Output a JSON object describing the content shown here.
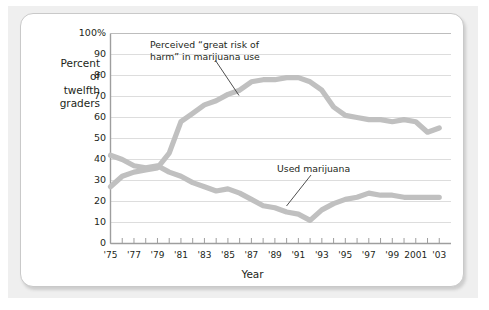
{
  "figure": {
    "y_axis_title": "Percent\nof\ntwelfth\ngraders",
    "x_axis_title": "Year",
    "frame_color": "#c9c9c9",
    "line_color": "#c0c0c0",
    "grid_color": "#d9d9d9",
    "text_color": "#231f20"
  },
  "annotations": {
    "risk": "Perceived “great risk of\nharm” in marijuana use",
    "use": "Used marijuana"
  },
  "chart_data": {
    "type": "line",
    "title": "",
    "xlabel": "Year",
    "ylabel": "Percent of twelfth graders",
    "xlim": [
      1975,
      2004
    ],
    "ylim": [
      0,
      100
    ],
    "grid": true,
    "legend_position": "inline-annotations",
    "ytick_labels": [
      "0",
      "10",
      "20",
      "30",
      "40",
      "50",
      "60",
      "70",
      "80",
      "90",
      "100%"
    ],
    "ytick_values": [
      0,
      10,
      20,
      30,
      40,
      50,
      60,
      70,
      80,
      90,
      100
    ],
    "xtick_values": [
      1975,
      1976,
      1977,
      1978,
      1979,
      1980,
      1981,
      1982,
      1983,
      1984,
      1985,
      1986,
      1987,
      1988,
      1989,
      1990,
      1991,
      1992,
      1993,
      1994,
      1995,
      1996,
      1997,
      1998,
      1999,
      2000,
      2001,
      2002,
      2003
    ],
    "xtick_labels": [
      {
        "value": 1975,
        "label": "'75"
      },
      {
        "value": 1977,
        "label": "'77"
      },
      {
        "value": 1979,
        "label": "'79"
      },
      {
        "value": 1981,
        "label": "'81"
      },
      {
        "value": 1983,
        "label": "'83"
      },
      {
        "value": 1985,
        "label": "'85"
      },
      {
        "value": 1987,
        "label": "'87"
      },
      {
        "value": 1989,
        "label": "'89"
      },
      {
        "value": 1991,
        "label": "'91"
      },
      {
        "value": 1993,
        "label": "'93"
      },
      {
        "value": 1995,
        "label": "'95"
      },
      {
        "value": 1997,
        "label": "'97"
      },
      {
        "value": 1999,
        "label": "'99"
      },
      {
        "value": 2001,
        "label": "2001"
      },
      {
        "value": 2003,
        "label": "'03"
      }
    ],
    "x": [
      1975,
      1976,
      1977,
      1978,
      1979,
      1980,
      1981,
      1982,
      1983,
      1984,
      1985,
      1986,
      1987,
      1988,
      1989,
      1990,
      1991,
      1992,
      1993,
      1994,
      1995,
      1996,
      1997,
      1998,
      1999,
      2000,
      2001,
      2002,
      2003
    ],
    "series": [
      {
        "name": "Perceived “great risk of harm” in marijuana use",
        "color": "#c0c0c0",
        "values": [
          27,
          32,
          34,
          35,
          36,
          43,
          58,
          62,
          66,
          68,
          71,
          73,
          77,
          78,
          78,
          79,
          79,
          77,
          73,
          65,
          61,
          60,
          59,
          59,
          58,
          59,
          58,
          53,
          55
        ]
      },
      {
        "name": "Used marijuana",
        "color": "#c0c0c0",
        "values": [
          42,
          40,
          37,
          36,
          37,
          34,
          32,
          29,
          27,
          25,
          26,
          24,
          21,
          18,
          17,
          15,
          14,
          11,
          16,
          19,
          21,
          22,
          24,
          23,
          23,
          22,
          22,
          22,
          22
        ]
      }
    ]
  }
}
